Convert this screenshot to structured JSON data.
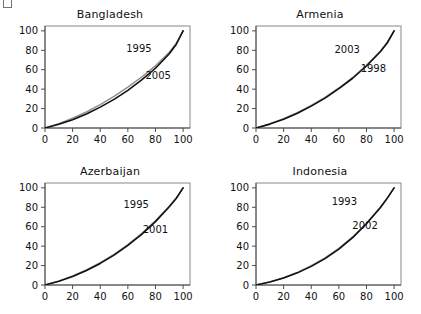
{
  "figure": {
    "width": 421,
    "height": 314,
    "background": "#ffffff",
    "layout": "2x2 panel grid of Lorenz-type cumulative curves"
  },
  "chart_data": [
    {
      "type": "line",
      "title": "Bangladesh",
      "xlabel": "",
      "ylabel": "",
      "xlim": [
        0,
        105
      ],
      "ylim": [
        0,
        105
      ],
      "xticks": [
        0,
        20,
        40,
        60,
        80,
        100
      ],
      "yticks": [
        0,
        20,
        40,
        60,
        80,
        100
      ],
      "xticklabels": [
        "0",
        "20",
        "40",
        "60",
        "80",
        "100"
      ],
      "yticklabels": [
        "0",
        "20",
        "40",
        "60",
        "80",
        "100"
      ],
      "grid": false,
      "legend": "inline-annotation",
      "annotations": [
        {
          "text": "1995",
          "x": 68,
          "y": 78
        },
        {
          "text": "2005",
          "x": 82,
          "y": 50
        }
      ],
      "series": [
        {
          "name": "1995",
          "color": "#8f8f8f",
          "x": [
            0,
            10,
            20,
            30,
            40,
            50,
            60,
            70,
            80,
            90,
            95,
            100
          ],
          "values": [
            0,
            4.5,
            10,
            16.5,
            24,
            32.5,
            42,
            52.5,
            64,
            78,
            87,
            100
          ]
        },
        {
          "name": "2005",
          "color": "#111111",
          "x": [
            0,
            10,
            20,
            30,
            40,
            50,
            60,
            70,
            80,
            90,
            95,
            100
          ],
          "values": [
            0,
            3.8,
            8.6,
            14.5,
            21.5,
            29.5,
            38.8,
            49.5,
            61.5,
            76.5,
            86,
            100
          ]
        }
      ]
    },
    {
      "type": "line",
      "title": "Armenia",
      "xlabel": "",
      "ylabel": "",
      "xlim": [
        0,
        105
      ],
      "ylim": [
        0,
        105
      ],
      "xticks": [
        0,
        20,
        40,
        60,
        80,
        100
      ],
      "yticks": [
        0,
        20,
        40,
        60,
        80,
        100
      ],
      "xticklabels": [
        "0",
        "20",
        "40",
        "60",
        "80",
        "100"
      ],
      "yticklabels": [
        "0",
        "20",
        "40",
        "60",
        "80",
        "100"
      ],
      "grid": false,
      "legend": "inline-annotation",
      "annotations": [
        {
          "text": "2003",
          "x": 66,
          "y": 77
        },
        {
          "text": "1998",
          "x": 85,
          "y": 58
        }
      ],
      "series": [
        {
          "name": "2003",
          "color": "#8f8f8f",
          "x": [
            0,
            10,
            20,
            30,
            40,
            50,
            60,
            70,
            80,
            90,
            95,
            100
          ],
          "values": [
            0,
            4.2,
            9.5,
            15.8,
            23.2,
            31.5,
            41.2,
            52.0,
            64.5,
            79.0,
            88.0,
            100
          ]
        },
        {
          "name": "1998",
          "color": "#111111",
          "x": [
            0,
            10,
            20,
            30,
            40,
            50,
            60,
            70,
            80,
            90,
            95,
            100
          ],
          "values": [
            0,
            4.0,
            9.0,
            15.2,
            22.5,
            30.8,
            40.5,
            51.2,
            63.8,
            78.5,
            87.5,
            100
          ]
        }
      ]
    },
    {
      "type": "line",
      "title": "Azerbaijan",
      "xlabel": "",
      "ylabel": "",
      "xlim": [
        0,
        105
      ],
      "ylim": [
        0,
        105
      ],
      "xticks": [
        0,
        20,
        40,
        60,
        80,
        100
      ],
      "yticks": [
        0,
        20,
        40,
        60,
        80,
        100
      ],
      "xticklabels": [
        "0",
        "20",
        "40",
        "60",
        "80",
        "100"
      ],
      "yticklabels": [
        "0",
        "20",
        "40",
        "60",
        "80",
        "100"
      ],
      "grid": false,
      "legend": "inline-annotation",
      "annotations": [
        {
          "text": "1995",
          "x": 66,
          "y": 79
        },
        {
          "text": "2001",
          "x": 80,
          "y": 54
        }
      ],
      "series": [
        {
          "name": "1995",
          "color": "#8f8f8f",
          "x": [
            0,
            10,
            20,
            30,
            40,
            50,
            60,
            70,
            80,
            90,
            95,
            100
          ],
          "values": [
            0,
            4.0,
            9.2,
            15.5,
            23.0,
            31.5,
            41.5,
            53.0,
            66.0,
            81.0,
            89.5,
            100
          ]
        },
        {
          "name": "2001",
          "color": "#111111",
          "x": [
            0,
            10,
            20,
            30,
            40,
            50,
            60,
            70,
            80,
            90,
            95,
            100
          ],
          "values": [
            0,
            3.8,
            8.8,
            15.0,
            22.2,
            30.8,
            40.8,
            52.2,
            65.2,
            80.5,
            89.0,
            100
          ]
        }
      ]
    },
    {
      "type": "line",
      "title": "Indonesia",
      "xlabel": "",
      "ylabel": "",
      "xlim": [
        0,
        105
      ],
      "ylim": [
        0,
        105
      ],
      "xticks": [
        0,
        20,
        40,
        60,
        80,
        100
      ],
      "yticks": [
        0,
        20,
        40,
        60,
        80,
        100
      ],
      "xticklabels": [
        "0",
        "20",
        "40",
        "60",
        "80",
        "100"
      ],
      "yticklabels": [
        "0",
        "20",
        "40",
        "60",
        "80",
        "100"
      ],
      "grid": false,
      "legend": "inline-annotation",
      "annotations": [
        {
          "text": "1993",
          "x": 64,
          "y": 82
        },
        {
          "text": "2002",
          "x": 79,
          "y": 58
        }
      ],
      "series": [
        {
          "name": "1993",
          "color": "#8f8f8f",
          "x": [
            0,
            10,
            20,
            30,
            40,
            50,
            60,
            70,
            80,
            90,
            95,
            100
          ],
          "values": [
            0,
            3.2,
            7.5,
            13.0,
            19.8,
            28.0,
            37.8,
            49.5,
            63.5,
            80.0,
            89.5,
            100
          ]
        },
        {
          "name": "2002",
          "color": "#111111",
          "x": [
            0,
            10,
            20,
            30,
            40,
            50,
            60,
            70,
            80,
            90,
            95,
            100
          ],
          "values": [
            0,
            3.0,
            7.2,
            12.5,
            19.2,
            27.2,
            37.0,
            48.8,
            63.0,
            79.5,
            89.2,
            100
          ]
        }
      ]
    }
  ],
  "panels": [
    {
      "title": "Bangladesh",
      "labels": [
        "1995",
        "2005"
      ]
    },
    {
      "title": "Armenia",
      "labels": [
        "2003",
        "1998"
      ]
    },
    {
      "title": "Azerbaijan",
      "labels": [
        "1995",
        "2001"
      ]
    },
    {
      "title": "Indonesia",
      "labels": [
        "1993",
        "2002"
      ]
    }
  ],
  "colors": {
    "curve_primary": "#111111",
    "curve_secondary": "#8f8f8f",
    "axis": "#4d4d4d",
    "frame": "#888888",
    "text": "#111111",
    "background": "#ffffff"
  }
}
